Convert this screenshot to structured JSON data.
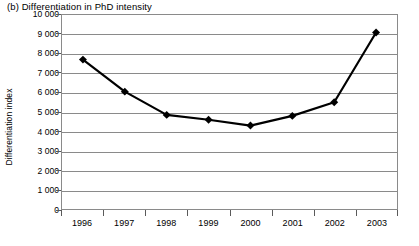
{
  "chart_data": {
    "type": "line",
    "title": "(b) Differentiation in PhD intensity",
    "xlabel": "",
    "ylabel": "Differentiation index",
    "categories": [
      "1996",
      "1997",
      "1998",
      "1999",
      "2000",
      "2001",
      "2002",
      "2003"
    ],
    "values": [
      7700,
      6050,
      4850,
      4600,
      4300,
      4800,
      5500,
      9100
    ],
    "series": [
      {
        "name": "Differentiation index",
        "values": [
          7700,
          6050,
          4850,
          4600,
          4300,
          4800,
          5500,
          9100
        ]
      }
    ],
    "ylim": [
      0,
      10000
    ],
    "ytick_values": [
      0,
      1000,
      2000,
      3000,
      4000,
      5000,
      6000,
      7000,
      8000,
      9000,
      10000
    ],
    "ytick_labels": [
      "0",
      "1 000",
      "2 000",
      "3 000",
      "4 000",
      "5 000",
      "6 000",
      "7 000",
      "8 000",
      "9 000",
      "10 000"
    ],
    "grid": "horizontal",
    "legend": "none",
    "marker": "diamond",
    "marker_color": "#000000",
    "line_color": "#000000",
    "grid_color": "#8a8a8a",
    "background_color": "#ffffff"
  }
}
